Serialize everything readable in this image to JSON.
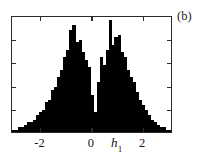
{
  "figure": {
    "panel_label": "(b)",
    "background_color": "#ffffff",
    "frame_color": "#2b2b2b",
    "bar_color": "#000000"
  },
  "axes": {
    "x_label_base": "h",
    "x_label_subscript": "1",
    "x_label_text": "h1",
    "x_tick_labels": [
      "-2",
      "0",
      "2"
    ],
    "x_tick_values": [
      -2,
      0,
      2
    ],
    "y_tick_labels": [],
    "x_range": [
      -3.11,
      3.16
    ],
    "y_range": [
      0,
      47
    ]
  },
  "chart_data": {
    "type": "bar",
    "title": "",
    "subtitle": "",
    "xlabel": "h1",
    "ylabel": "",
    "grid": false,
    "legend": null,
    "annotations": [
      "(b)"
    ],
    "xlim": [
      -3.11,
      3.16
    ],
    "ylim": [
      0,
      47
    ],
    "bin_width": 0.117,
    "categories": [
      "-3.05",
      "-2.93",
      "-2.81",
      "-2.70",
      "-2.58",
      "-2.46",
      "-2.34",
      "-2.23",
      "-2.11",
      "-1.99",
      "-1.87",
      "-1.76",
      "-1.64",
      "-1.52",
      "-1.40",
      "-1.29",
      "-1.17",
      "-1.05",
      "-0.93",
      "-0.82",
      "-0.70",
      "-0.58",
      "-0.46",
      "-0.35",
      "-0.23",
      "-0.11",
      "0.01",
      "0.12",
      "0.24",
      "0.36",
      "0.47",
      "0.59",
      "0.71",
      "0.83",
      "0.94",
      "1.06",
      "1.18",
      "1.30",
      "1.41",
      "1.53",
      "1.65",
      "1.77",
      "1.88",
      "2.00",
      "2.12",
      "2.24",
      "2.35",
      "2.47",
      "2.59",
      "2.71",
      "2.82",
      "2.94",
      "3.06"
    ],
    "values": [
      1,
      1,
      2,
      2,
      3,
      4,
      4,
      5,
      7,
      8,
      9,
      12,
      13,
      17,
      18,
      22,
      25,
      30,
      33,
      41,
      43,
      36,
      37,
      32,
      29,
      26,
      15,
      8,
      20,
      30,
      27,
      33,
      45,
      35,
      38,
      39,
      32,
      30,
      25,
      22,
      20,
      16,
      13,
      11,
      9,
      7,
      5,
      4,
      3,
      2,
      2,
      1,
      1
    ]
  }
}
